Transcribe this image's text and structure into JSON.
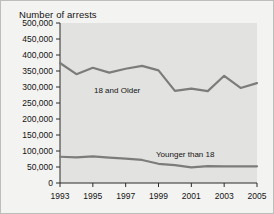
{
  "figure": {
    "title": "Number of arrests",
    "background_color": "#f3f3f1",
    "plot_background_color": "#e2e2e0",
    "line_color": "#7c7c7a",
    "axis_color": "#2b2b2b"
  },
  "chart_data": {
    "type": "line",
    "title": "Number of arrests",
    "xlabel": "",
    "ylabel": "",
    "grid": false,
    "legend_position": "inline-annotation",
    "xlim": [
      1993,
      2005
    ],
    "ylim": [
      0,
      500000
    ],
    "x": [
      1993,
      1994,
      1995,
      1996,
      1997,
      1998,
      1999,
      2000,
      2001,
      2002,
      2003,
      2004,
      2005
    ],
    "xticks": [
      1993,
      1995,
      1997,
      1999,
      2001,
      2003,
      2005
    ],
    "xtick_labels": [
      "1993",
      "1995",
      "1997",
      "1999",
      "2001",
      "2003",
      "2005"
    ],
    "yticks": [
      0,
      50000,
      100000,
      150000,
      200000,
      250000,
      300000,
      350000,
      400000,
      450000,
      500000
    ],
    "ytick_labels": [
      "0",
      "50,000",
      "100,000",
      "150,000",
      "200,000",
      "250,000",
      "300,000",
      "350,000",
      "400,000",
      "450,000",
      "500,000"
    ],
    "series": [
      {
        "name": "18 and Older",
        "label": "18 and Older",
        "values": [
          375000,
          340000,
          360000,
          345000,
          357000,
          366000,
          352000,
          288000,
          295000,
          287000,
          335000,
          297000,
          312000
        ]
      },
      {
        "name": "Younger than 18",
        "label": "Younger than 18",
        "values": [
          82000,
          80000,
          83000,
          79000,
          76000,
          72000,
          60000,
          56000,
          49000,
          53000,
          52000,
          52000,
          52000
        ]
      }
    ]
  }
}
